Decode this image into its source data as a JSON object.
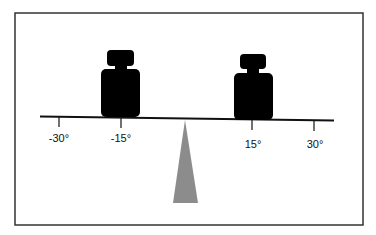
{
  "diagram": {
    "type": "balance-scale",
    "colors": {
      "frame": "#333333",
      "beam": "#111111",
      "weight": "#000000",
      "fulcrum": "#8c8c8c",
      "background": "#ffffff"
    },
    "ticks": [
      {
        "id": "tick-neg-30",
        "label": "-30°",
        "position": -30
      },
      {
        "id": "tick-neg-15",
        "label": "-15°",
        "position": -15
      },
      {
        "id": "tick-pos-15",
        "label": "15°",
        "position": 15
      },
      {
        "id": "tick-pos-30",
        "label": "30°",
        "position": 30
      }
    ],
    "weights": [
      {
        "id": "left-weight",
        "position": -15
      },
      {
        "id": "right-weight",
        "position": 15
      }
    ]
  }
}
